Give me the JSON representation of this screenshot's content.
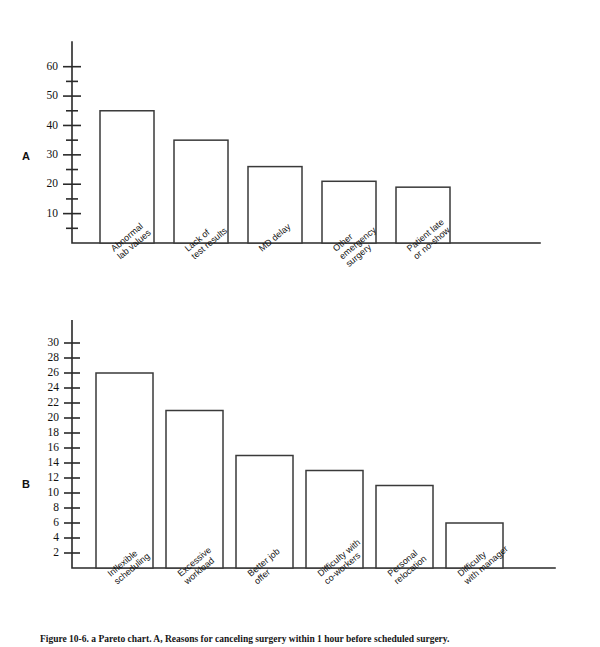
{
  "figure": {
    "caption": "Figure 10-6. a Pareto chart. A, Reasons for canceling surgery within 1 hour before scheduled surgery."
  },
  "panels": {
    "a": {
      "letter": "A"
    },
    "b": {
      "letter": "B"
    }
  },
  "chart_data": [
    {
      "type": "bar",
      "panel": "A",
      "title": "",
      "xlabel": "",
      "ylabel": "",
      "categories": [
        "Abnormal\nlab values",
        "Lack of\ntest results",
        "MD delay",
        "Other\nemergency\nsurgery",
        "Patient late\nor no-show"
      ],
      "values": [
        45,
        35,
        26,
        21,
        19
      ],
      "ylim": [
        0,
        65
      ],
      "ytick_labels": [
        "10",
        "20",
        "30",
        "40",
        "50",
        "60"
      ],
      "ytick_values": [
        10,
        20,
        30,
        40,
        50,
        60
      ],
      "yminor_values": [
        5,
        15,
        25,
        35,
        45,
        55
      ],
      "grid": false,
      "legend": "none"
    },
    {
      "type": "bar",
      "panel": "B",
      "title": "",
      "xlabel": "",
      "ylabel": "",
      "categories": [
        "Inflexible\nscheduling",
        "Excessive\nworkload",
        "Better job\noffer",
        "Difficulty with\nco-workers",
        "Personal\nrelocation",
        "Difficulty\nwith manager"
      ],
      "values": [
        26,
        21,
        15,
        13,
        11,
        6
      ],
      "ylim": [
        0,
        32
      ],
      "ytick_labels": [
        "2",
        "4",
        "6",
        "8",
        "10",
        "12",
        "14",
        "16",
        "18",
        "20",
        "22",
        "24",
        "26",
        "28",
        "30"
      ],
      "ytick_values": [
        2,
        4,
        6,
        8,
        10,
        12,
        14,
        16,
        18,
        20,
        22,
        24,
        26,
        28,
        30
      ],
      "yminor_values": [],
      "grid": false,
      "legend": "none"
    }
  ]
}
